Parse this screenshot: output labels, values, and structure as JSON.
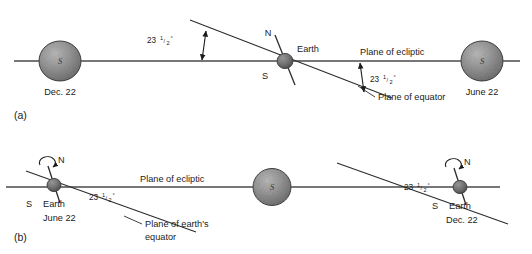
{
  "figure": {
    "background_color": "#ffffff",
    "line_color": "#4a4a4a",
    "text_color": "#1b1b1b",
    "sun_color": "#8f8f8f",
    "earth_color": "#6e6e6e"
  },
  "panels": [
    {
      "id": "a",
      "label": "(a)",
      "bodies": [
        {
          "name": "sun-left",
          "type": "sun",
          "glyph": "S",
          "caption": "Dec. 22"
        },
        {
          "name": "earth-center",
          "type": "earth",
          "caption": "Earth",
          "north_label": "N",
          "south_label": "S"
        },
        {
          "name": "sun-right",
          "type": "sun",
          "glyph": "S",
          "caption": "June 22"
        }
      ],
      "plane_labels": [
        {
          "name": "plane-of-ecliptic",
          "text": "Plane of ecliptic"
        },
        {
          "name": "plane-of-equator",
          "text": "Plane of equator"
        }
      ],
      "angles": [
        {
          "name": "tilt-angle-left",
          "value": "23",
          "fraction": "1/2",
          "unit": "°",
          "text": "23½°"
        },
        {
          "name": "tilt-angle-right",
          "value": "23",
          "fraction": "1/2",
          "unit": "°",
          "text": "23½°"
        }
      ]
    },
    {
      "id": "b",
      "label": "(b)",
      "bodies": [
        {
          "name": "earth-left",
          "type": "earth",
          "caption": "Earth",
          "date": "June 22",
          "north_label": "N",
          "south_label": "S",
          "rotation": "counterclockwise"
        },
        {
          "name": "sun-center",
          "type": "sun",
          "glyph": "S",
          "caption": ""
        },
        {
          "name": "earth-right",
          "type": "earth",
          "caption": "Earth",
          "date": "Dec. 22",
          "north_label": "N",
          "south_label": "S",
          "rotation": "counterclockwise"
        }
      ],
      "plane_labels": [
        {
          "name": "plane-of-ecliptic",
          "text": "Plane of ecliptic"
        },
        {
          "name": "plane-of-earths-equator-line1",
          "text": "Plane of earth's"
        },
        {
          "name": "plane-of-earths-equator-line2",
          "text": "equator"
        }
      ],
      "angles": [
        {
          "name": "tilt-angle-left",
          "value": "23",
          "fraction": "1/2",
          "unit": "°",
          "text": "23½°"
        },
        {
          "name": "tilt-angle-right",
          "value": "23",
          "fraction": "1/2",
          "unit": "°",
          "text": "23½°"
        }
      ]
    }
  ],
  "text": {
    "panel_a_label": "(a)",
    "panel_b_label": "(b)",
    "dec22": "Dec. 22",
    "june22": "June 22",
    "earth": "Earth",
    "sun_glyph": "S",
    "north": "N",
    "south": "S",
    "plane_of_ecliptic": "Plane of ecliptic",
    "plane_of_equator": "Plane of equator",
    "plane_of_earths": "Plane of earth's",
    "equator": "equator",
    "angle_num": "23",
    "angle_frac_num": "1",
    "angle_frac_den": "2",
    "angle_deg": "°"
  }
}
